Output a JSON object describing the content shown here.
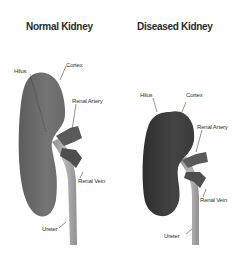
{
  "diagram": {
    "panels": [
      {
        "title": "Normal Kidney",
        "labels": {
          "hilus": "Hilus",
          "cortex": "Cortex",
          "renal_artery": "Renal Artery",
          "renal_vein": "Renal Vein",
          "ureter": "Ureter"
        },
        "kidney_color": "#6e6e6e"
      },
      {
        "title": "Diseased Kidney",
        "labels": {
          "hilus": "Hilus",
          "cortex": "Cortex",
          "renal_artery": "Renal Artery",
          "renal_vein": "Renal Vein",
          "ureter": "Ureter"
        },
        "kidney_color": "#3c3c3c"
      }
    ],
    "colors": {
      "background": "#ffffff",
      "vessel": "#5a5a5a",
      "ureter": "#a8a8a8",
      "text": "#2a2a2a"
    }
  }
}
